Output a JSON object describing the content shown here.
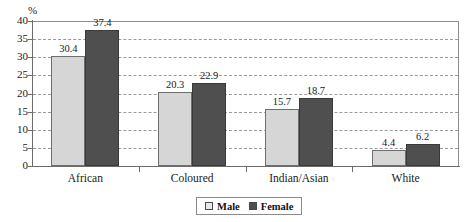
{
  "chart_data": {
    "type": "bar",
    "title": "",
    "subtitle": "",
    "xlabel": "",
    "ylabel": "%",
    "ylim": [
      0,
      40
    ],
    "ytick_step": 5,
    "grid": true,
    "grid_style": "dashed-horizontal",
    "legend_position": "bottom-center",
    "categories": [
      "African",
      "Coloured",
      "Indian/Asian",
      "White"
    ],
    "series": [
      {
        "name": "Male",
        "color": "#d6d6d6",
        "values": [
          30.4,
          20.3,
          15.7,
          4.4
        ]
      },
      {
        "name": "Female",
        "color": "#4f4f4f",
        "values": [
          37.4,
          22.9,
          18.7,
          6.2
        ]
      }
    ],
    "yticks": [
      "0",
      "5",
      "10",
      "15",
      "20",
      "25",
      "30",
      "35",
      "40"
    ],
    "data_labels": [
      "30.4",
      "37.4",
      "20.3",
      "22.9",
      "15.7",
      "18.7",
      "4.4",
      "6.2"
    ]
  },
  "axis": {
    "percent_symbol": "%"
  },
  "legend": {
    "male_label": "Male",
    "female_label": "Female"
  }
}
